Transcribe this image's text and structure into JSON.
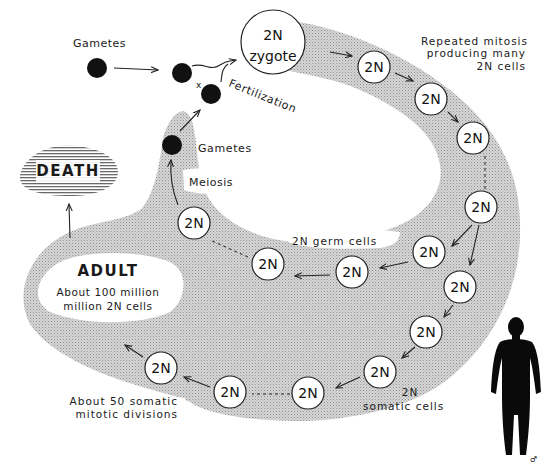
{
  "diagram": {
    "colors": {
      "stipple_fill": "#cfcfcf",
      "stipple_dot": "#9a9a9a",
      "ink": "#1a1a1a",
      "gamete": "#111111",
      "death_stripe": "#6a6a6a"
    },
    "labels": {
      "gametes_top": "Gametes",
      "fertilization": "Fertilization",
      "cross": "x",
      "gametes_mid": "Gametes",
      "meiosis": "Meiosis",
      "death": "DEATH",
      "zygote_ploidy": "2N",
      "zygote": "zygote",
      "repeated_1": "Repeated mitosis",
      "repeated_2": "producing many",
      "repeated_3": "2N cells",
      "germ_cells": "2N germ cells",
      "adult_title": "ADULT",
      "adult_1": "About 100 million",
      "adult_2": "million 2N cells",
      "somatic_divisions_1": "About 50 somatic",
      "somatic_divisions_2": "mitotic divisions",
      "somatic_cells_1": "2N",
      "somatic_cells_2": "somatic cells",
      "male_symbol": "♂"
    },
    "cell_label": "2N",
    "cells": [
      {
        "id": "mitosis-1",
        "x": 374,
        "y": 67
      },
      {
        "id": "mitosis-2",
        "x": 431,
        "y": 99
      },
      {
        "id": "mitosis-3",
        "x": 473,
        "y": 138
      },
      {
        "id": "branch-point",
        "x": 481,
        "y": 207
      },
      {
        "id": "germ-1",
        "x": 429,
        "y": 252
      },
      {
        "id": "germ-2",
        "x": 356,
        "y": 270
      },
      {
        "id": "germ-3",
        "x": 266,
        "y": 263
      },
      {
        "id": "germ-4",
        "x": 192,
        "y": 222
      },
      {
        "id": "somatic-1",
        "x": 460,
        "y": 287
      },
      {
        "id": "somatic-2",
        "x": 428,
        "y": 331
      },
      {
        "id": "somatic-3",
        "x": 380,
        "y": 371
      },
      {
        "id": "somatic-4",
        "x": 310,
        "y": 393
      },
      {
        "id": "somatic-5",
        "x": 230,
        "y": 392
      },
      {
        "id": "somatic-6",
        "x": 161,
        "y": 368
      }
    ]
  }
}
